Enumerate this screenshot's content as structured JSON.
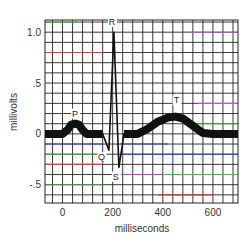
{
  "chart_data": {
    "type": "line",
    "title": "",
    "xlabel": "milliseconds",
    "ylabel": "millivolts",
    "xlim": [
      -70,
      700
    ],
    "ylim": [
      -0.68,
      1.12
    ],
    "x_ticks": [
      {
        "value": 0,
        "label": "0"
      },
      {
        "value": 200,
        "label": "200"
      },
      {
        "value": 400,
        "label": "400"
      },
      {
        "value": 600,
        "label": "600"
      }
    ],
    "y_ticks": [
      {
        "value": 1.0,
        "label": "1.0"
      },
      {
        "value": 0.5,
        "label": ".5"
      },
      {
        "value": 0,
        "label": "0"
      },
      {
        "value": -0.5,
        "label": "-.5"
      }
    ],
    "grid": true,
    "grid_step": {
      "x_ms": 40,
      "y_mv": 0.1
    },
    "grid_color": "#222222",
    "trace_color": "#111111",
    "series": [
      {
        "name": "ECG",
        "points": [
          [
            -70,
            0.0
          ],
          [
            0,
            0.0
          ],
          [
            20,
            0.04
          ],
          [
            35,
            0.09
          ],
          [
            50,
            0.1
          ],
          [
            65,
            0.09
          ],
          [
            80,
            0.04
          ],
          [
            95,
            0.0
          ],
          [
            160,
            0.0
          ],
          [
            185,
            -0.16
          ],
          [
            205,
            1.0
          ],
          [
            225,
            -0.33
          ],
          [
            245,
            0.0
          ],
          [
            300,
            0.0
          ],
          [
            340,
            0.05
          ],
          [
            380,
            0.12
          ],
          [
            420,
            0.16
          ],
          [
            450,
            0.17
          ],
          [
            480,
            0.15
          ],
          [
            520,
            0.08
          ],
          [
            560,
            0.01
          ],
          [
            600,
            0.0
          ],
          [
            700,
            0.0
          ]
        ]
      }
    ],
    "annotations": [
      {
        "text": "P",
        "x": 50,
        "y": 0.17
      },
      {
        "text": "R",
        "x": 197,
        "y": 1.07
      },
      {
        "text": "Q",
        "x": 155,
        "y": -0.26
      },
      {
        "text": "S",
        "x": 212,
        "y": -0.45
      },
      {
        "text": "T",
        "x": 455,
        "y": 0.3
      }
    ],
    "colored_grid_lines": [
      {
        "y": 0.8,
        "from": -70,
        "to": 160,
        "color": "#d04040"
      },
      {
        "y": 1.1,
        "from": -70,
        "to": 60,
        "color": "#40b040"
      },
      {
        "y": 1.0,
        "from": 480,
        "to": 700,
        "color": "#b060c0"
      },
      {
        "y": 0.3,
        "from": 540,
        "to": 700,
        "color": "#b060c0"
      },
      {
        "y": 0.1,
        "from": 460,
        "to": 700,
        "color": "#40b040"
      },
      {
        "y": -0.1,
        "from": -70,
        "to": 160,
        "color": "#3040c0"
      },
      {
        "y": -0.1,
        "from": 230,
        "to": 420,
        "color": "#3040c0"
      },
      {
        "y": -0.2,
        "from": -70,
        "to": 160,
        "color": "#40b040"
      },
      {
        "y": -0.2,
        "from": 230,
        "to": 700,
        "color": "#3040c0"
      },
      {
        "y": -0.3,
        "from": -70,
        "to": 160,
        "color": "#d04040"
      },
      {
        "y": -0.4,
        "from": 230,
        "to": 400,
        "color": "#c040c0"
      },
      {
        "y": -0.4,
        "from": 400,
        "to": 700,
        "color": "#40c040"
      },
      {
        "y": -0.5,
        "from": -70,
        "to": 160,
        "color": "#40b040"
      },
      {
        "y": -0.6,
        "from": 380,
        "to": 600,
        "color": "#d04040"
      }
    ]
  }
}
